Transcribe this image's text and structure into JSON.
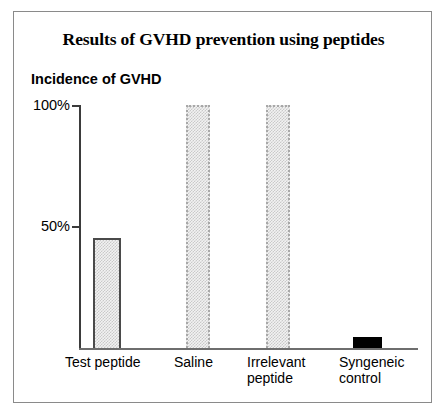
{
  "chart_data": {
    "type": "bar",
    "title": "Results of GVHD prevention using peptides",
    "ylabel": "Incidence of GVHD",
    "xlabel": "",
    "categories": [
      "Test peptide",
      "Saline",
      "Irrelevant\npeptide",
      "Syngeneic\ncontrol"
    ],
    "values": [
      45,
      100,
      100,
      4
    ],
    "value_unit": "%",
    "ylim": [
      0,
      100
    ],
    "yticks": [
      50,
      100
    ],
    "ytick_labels": [
      "50%",
      "100%"
    ],
    "grid": false,
    "legend": false,
    "series": [
      {
        "name": "Incidence of GVHD",
        "values": [
          45,
          100,
          100,
          4
        ],
        "bar_styles": [
          "grey-dither-solid-outline",
          "grey-dither-dotted-outline",
          "grey-dither-dotted-outline",
          "solid-black"
        ]
      }
    ],
    "colors": {
      "bar_fill_grey": "#e8e8e8",
      "bar_fill_pattern": "#c9c9c9",
      "bar_outline_dark": "#4a4a4a",
      "bar_outline_light": "#a8a8a8",
      "bar_solid_black": "#000000",
      "axis": "#3b3b3b",
      "frame_border": "#8a8a8a",
      "background": "#ffffff",
      "text": "#000000"
    }
  },
  "figure": {
    "title": "Results of GVHD prevention using peptides",
    "y_axis_title": "Incidence of GVHD",
    "y_ticks": [
      {
        "label": "100%"
      },
      {
        "label": "50%"
      }
    ],
    "categories": [
      {
        "label": "Test peptide"
      },
      {
        "label": "Saline"
      },
      {
        "label": "Irrelevant\npeptide"
      },
      {
        "label": "Syngeneic\ncontrol"
      }
    ]
  }
}
